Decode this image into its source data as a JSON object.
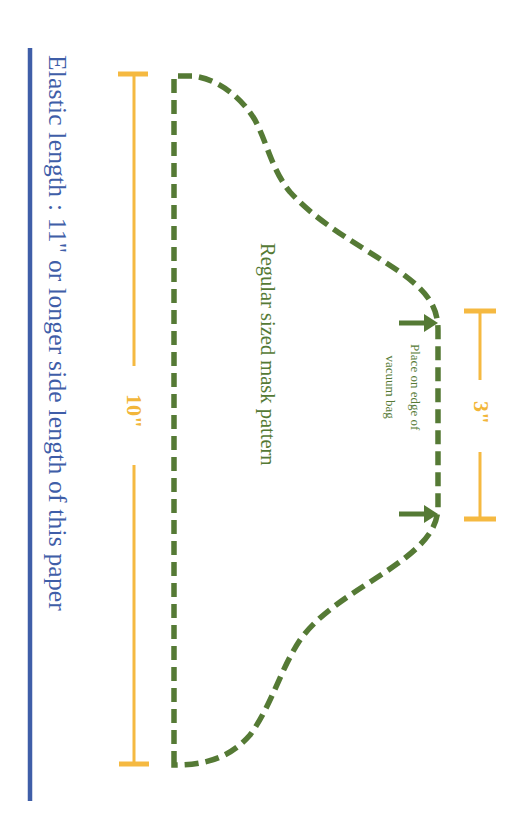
{
  "colors": {
    "elastic_blue": "#3f5ea8",
    "pattern_green": "#557a35",
    "dimension_orange": "#f5b941",
    "background": "#ffffff"
  },
  "elastic": {
    "label": "Elastic length :  11\" or longer side length of this paper"
  },
  "pattern": {
    "title": "Regular sized mask pattern",
    "note_line1": "Place on edge of",
    "note_line2": "vacuum bag"
  },
  "dimensions": {
    "height_label": "10\"",
    "edge_label": "3\""
  },
  "icons": {
    "placement_arrows": "arrow-right"
  }
}
